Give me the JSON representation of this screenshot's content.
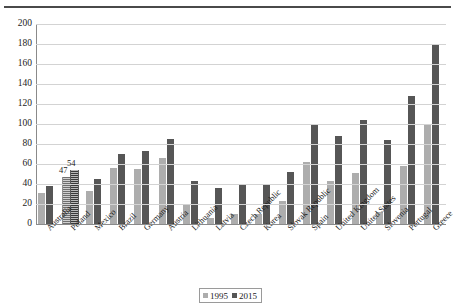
{
  "chart_data": {
    "type": "bar",
    "title": "",
    "xlabel": "",
    "ylabel": "",
    "ylim": [
      0,
      200
    ],
    "yticks": [
      0,
      20,
      40,
      60,
      80,
      100,
      120,
      140,
      160,
      180,
      200
    ],
    "grid": true,
    "legend_position": "bottom",
    "categories": [
      "Australia",
      "Poland",
      "Mexico",
      "Brazil",
      "Germany",
      "Austria",
      "Lithuania",
      "Latvia",
      "Czech Republic",
      "Korea",
      "Slovak Republic",
      "Spain",
      "United Kingdom",
      "United States",
      "Slovenia",
      "Portugal",
      "Greece"
    ],
    "series": [
      {
        "name": "1995",
        "color": "#adadad",
        "values": [
          31,
          47,
          33,
          56,
          55,
          66,
          20,
          6,
          10,
          10,
          23,
          62,
          43,
          51,
          12,
          58,
          99
        ]
      },
      {
        "name": "2015",
        "color": "#565656",
        "values": [
          38,
          54,
          45,
          70,
          73,
          85,
          43,
          36,
          39,
          39,
          52,
          100,
          88,
          104,
          84,
          128,
          180
        ]
      }
    ],
    "data_labels": [
      {
        "category": "Poland",
        "series": "1995",
        "text": "47"
      },
      {
        "category": "Poland",
        "series": "2015",
        "text": "54"
      }
    ],
    "highlighted_category": "Poland",
    "legend": [
      "1995",
      "2015"
    ]
  },
  "legend": {
    "items": [
      {
        "label": "1995",
        "color": "#adadad"
      },
      {
        "label": "2015",
        "color": "#565656"
      }
    ]
  }
}
